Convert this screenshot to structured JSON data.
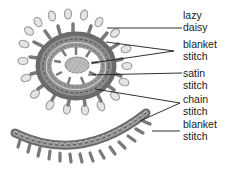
{
  "figure": {
    "colors": {
      "background": "#ffffff",
      "thread_dark": "#5a5a5a",
      "thread_mid": "#8a8a8a",
      "thread_light": "#c4c4c4",
      "leader_line": "#1a1a1a",
      "text": "#1a1a1a"
    },
    "labels": [
      {
        "line1": "lazy",
        "line2": "daisy"
      },
      {
        "line1": "blanket",
        "line2": "stitch"
      },
      {
        "line1": "satin",
        "line2": "stitch"
      },
      {
        "line1": "chain",
        "line2": "stitch"
      },
      {
        "line1": "blanket",
        "line2": "stitch"
      }
    ]
  }
}
